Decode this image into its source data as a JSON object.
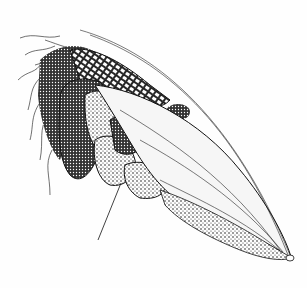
{
  "illustration": {
    "subject": "ear of corn with husk, silks and bulging smut galls",
    "style": "black ink stipple drawing on white",
    "colors": {
      "ink": "#111111",
      "paper": "#fefefe",
      "stipple_mid": "#555555",
      "husk_light": "#f4f4f4"
    },
    "leader_line": {
      "from": [
        98,
        240
      ],
      "to": [
        121,
        183
      ]
    }
  }
}
